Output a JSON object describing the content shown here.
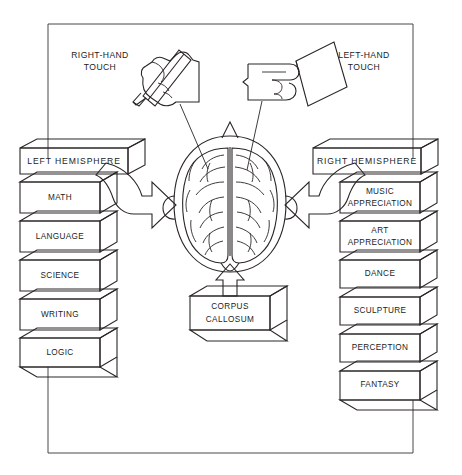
{
  "diagram": {
    "title_present": false,
    "type": "brain-hemisphere-function-diagram",
    "colors": {
      "ink": "#2a2626",
      "left_box_fill": "#c9c9c9",
      "right_box_fill": "#ffffff",
      "side_face_fill": "#ffffff",
      "brain_shaded_fill": "#d6d6d6",
      "background": "#ffffff"
    },
    "inputs": [
      {
        "id": "right-hand-touch",
        "label_line1": "RIGHT-HAND",
        "label_line2": "TOUCH",
        "icon": "hand-holding-pencil-icon"
      },
      {
        "id": "left-hand-touch",
        "label_line1": "LEFT-HAND",
        "label_line2": "TOUCH",
        "icon": "hand-holding-card-icon"
      }
    ],
    "left_hemisphere": {
      "header": "LEFT HEMISPHERE",
      "shaded": true,
      "functions": [
        {
          "label": "MATH"
        },
        {
          "label": "LANGUAGE"
        },
        {
          "label": "SCIENCE"
        },
        {
          "label": "WRITING"
        },
        {
          "label": "LOGIC"
        }
      ]
    },
    "right_hemisphere": {
      "header": "RIGHT  HEMISPHERE",
      "shaded": false,
      "functions": [
        {
          "label_line1": "MUSIC",
          "label_line2": "APPRECIATION"
        },
        {
          "label_line1": "ART",
          "label_line2": "APPRECIATION"
        },
        {
          "label_line1": "DANCE",
          "label_line2": ""
        },
        {
          "label_line1": "SCULPTURE",
          "label_line2": ""
        },
        {
          "label_line1": "PERCEPTION",
          "label_line2": ""
        },
        {
          "label_line1": "FANTASY",
          "label_line2": ""
        }
      ]
    },
    "center": {
      "corpus_callosum_line1": "CORPUS",
      "corpus_callosum_line2": "CALLOSUM",
      "brain_label": "brain-top-view-icon"
    }
  }
}
